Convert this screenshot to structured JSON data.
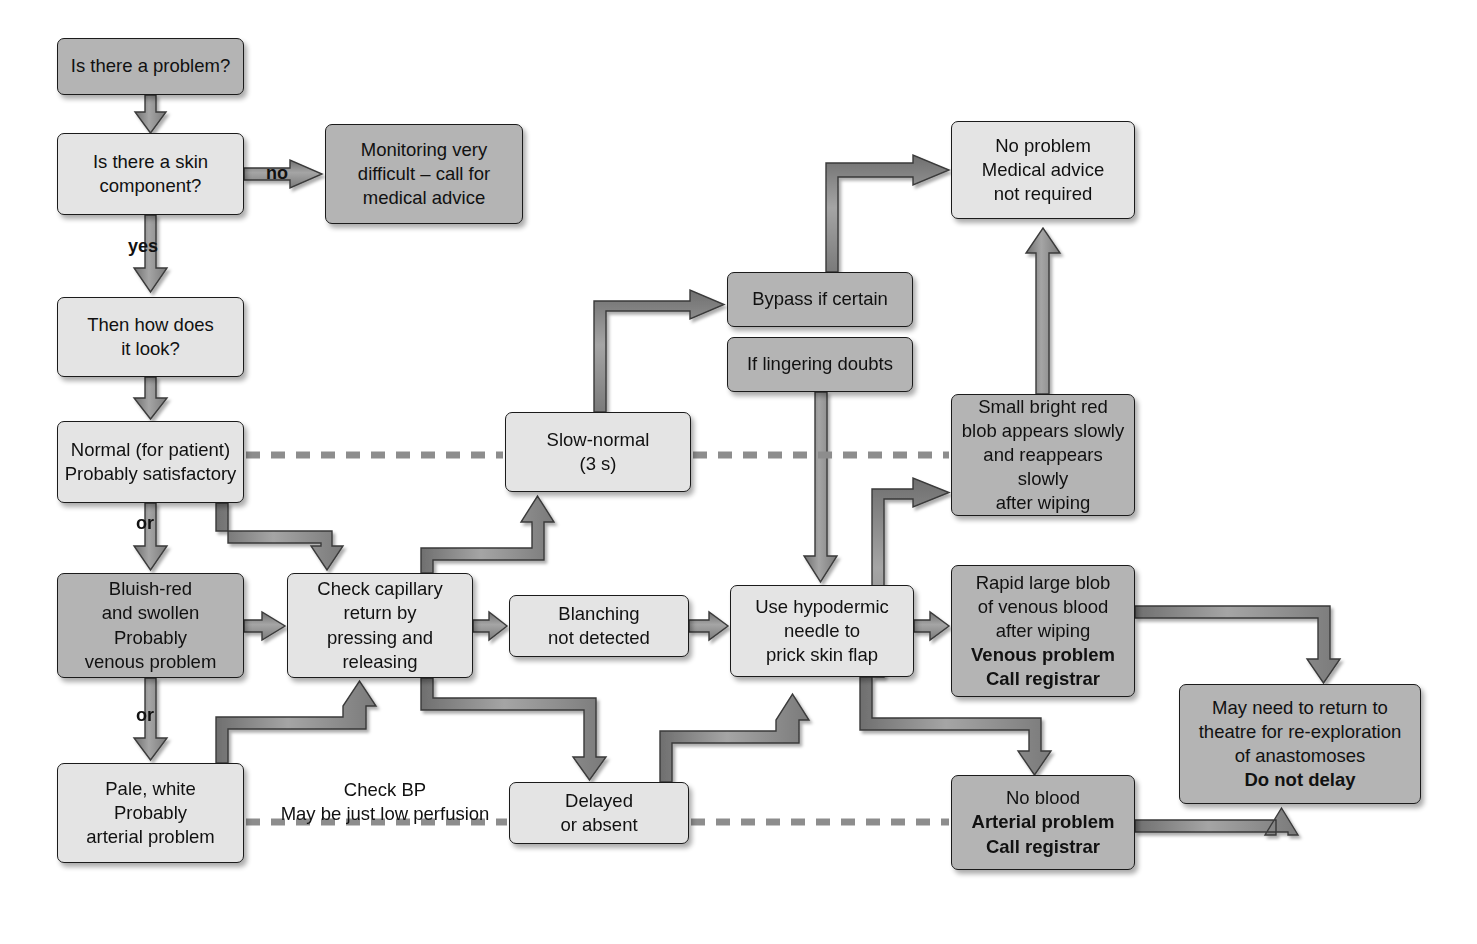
{
  "diagram": {
    "colors": {
      "fill_light": "#e4e4e4",
      "fill_dark": "#b4b4b4",
      "stroke": "#1b1b1b",
      "arrow_fill": "#8d8d8d",
      "arrow_stroke": "#3a3a3a",
      "dashed_line": "#8d8d8d",
      "background": "#ffffff"
    },
    "nodes": [
      {
        "id": "is_problem",
        "label": "Is there a problem?",
        "shade": "dark",
        "x": 57,
        "y": 38,
        "w": 187,
        "h": 57
      },
      {
        "id": "skin_component",
        "label": "Is there a skin\ncomponent?",
        "shade": "light",
        "x": 57,
        "y": 133,
        "w": 187,
        "h": 82
      },
      {
        "id": "monitoring",
        "label": "Monitoring very\ndifficult – call for\nmedical advice",
        "shade": "dark",
        "x": 325,
        "y": 124,
        "w": 198,
        "h": 100
      },
      {
        "id": "how_look",
        "label": "Then how does\nit look?",
        "shade": "light",
        "x": 57,
        "y": 297,
        "w": 187,
        "h": 80
      },
      {
        "id": "normal",
        "label": "Normal (for patient)\nProbably satisfactory",
        "shade": "light",
        "x": 57,
        "y": 421,
        "w": 187,
        "h": 82
      },
      {
        "id": "bluish_red",
        "label": "Bluish-red\nand swollen\nProbably\nvenous problem",
        "shade": "dark",
        "x": 57,
        "y": 573,
        "w": 187,
        "h": 105
      },
      {
        "id": "pale_white",
        "label": "Pale, white\nProbably\narterial problem",
        "shade": "light",
        "x": 57,
        "y": 763,
        "w": 187,
        "h": 100
      },
      {
        "id": "check_capillary",
        "label": "Check capillary\nreturn by\npressing and\nreleasing",
        "shade": "light",
        "x": 287,
        "y": 573,
        "w": 186,
        "h": 105
      },
      {
        "id": "slow_normal",
        "label": "Slow-normal\n(3 s)",
        "shade": "light",
        "x": 505,
        "y": 412,
        "w": 186,
        "h": 80
      },
      {
        "id": "blanching",
        "label": "Blanching\nnot detected",
        "shade": "light",
        "x": 509,
        "y": 595,
        "w": 180,
        "h": 62
      },
      {
        "id": "delayed",
        "label": "Delayed\nor absent",
        "shade": "light",
        "x": 509,
        "y": 782,
        "w": 180,
        "h": 62
      },
      {
        "id": "bypass",
        "label": "Bypass if certain",
        "shade": "dark",
        "x": 727,
        "y": 272,
        "w": 186,
        "h": 55
      },
      {
        "id": "lingering",
        "label": "If lingering doubts",
        "shade": "dark",
        "x": 727,
        "y": 337,
        "w": 186,
        "h": 55
      },
      {
        "id": "hypodermic",
        "label": "Use hypodermic\nneedle to\nprick skin flap",
        "shade": "light",
        "x": 730,
        "y": 585,
        "w": 184,
        "h": 92
      },
      {
        "id": "no_problem",
        "label": "No problem\nMedical advice\nnot required",
        "shade": "light",
        "x": 951,
        "y": 121,
        "w": 184,
        "h": 98
      },
      {
        "id": "small_blob",
        "label": "Small bright red\nblob appears slowly\nand reappears slowly\nafter wiping",
        "shade": "dark",
        "x": 951,
        "y": 394,
        "w": 184,
        "h": 122
      },
      {
        "id": "rapid_blob",
        "label": "Rapid large blob\nof venous blood\nafter wiping\n<b>Venous problem</b>\n<b>Call registrar</b>",
        "shade": "dark",
        "x": 951,
        "y": 565,
        "w": 184,
        "h": 132,
        "html": true
      },
      {
        "id": "no_blood",
        "label": "No blood\n<b>Arterial problem</b>\n<b>Call registrar</b>",
        "shade": "dark",
        "x": 951,
        "y": 775,
        "w": 184,
        "h": 95,
        "html": true
      },
      {
        "id": "theatre",
        "label": "May need to return to\ntheatre for re-exploration\nof anastomoses\n<b>Do not delay</b>",
        "shade": "dark",
        "x": 1179,
        "y": 684,
        "w": 242,
        "h": 120,
        "html": true
      }
    ],
    "edge_labels": [
      {
        "id": "no",
        "text": "no",
        "x": 266,
        "y": 163
      },
      {
        "id": "yes",
        "text": "yes",
        "x": 128,
        "y": 236
      },
      {
        "id": "or_1",
        "text": "or",
        "x": 132,
        "y": 520
      },
      {
        "id": "or_2",
        "text": "or",
        "x": 132,
        "y": 712
      }
    ],
    "free_labels": [
      {
        "id": "check_bp",
        "text": "Check BP\nMay be just low perfusion",
        "x": 270,
        "y": 778,
        "w": 230
      }
    ],
    "dashed_separators": [
      {
        "id": "dashed-upper-left",
        "x1": 246,
        "y1": 455,
        "x2": 503,
        "y2": 455
      },
      {
        "id": "dashed-upper-right",
        "x1": 693,
        "y1": 455,
        "x2": 949,
        "y2": 455
      },
      {
        "id": "dashed-lower-left",
        "x1": 246,
        "y1": 822,
        "x2": 507,
        "y2": 822
      },
      {
        "id": "dashed-lower-right",
        "x1": 691,
        "y1": 822,
        "x2": 949,
        "y2": 822
      }
    ],
    "connectors": [
      {
        "id": "is_problem-to-skin_component",
        "from": "is_problem",
        "to": "skin_component"
      },
      {
        "id": "skin_component-to-monitoring",
        "from": "skin_component",
        "to": "monitoring"
      },
      {
        "id": "skin_component-to-how_look",
        "from": "skin_component",
        "to": "how_look"
      },
      {
        "id": "how_look-to-normal",
        "from": "how_look",
        "to": "normal"
      },
      {
        "id": "normal-to-bluish_red",
        "from": "normal",
        "to": "bluish_red"
      },
      {
        "id": "normal-to-check_capillary",
        "from": "normal",
        "to": "check_capillary"
      },
      {
        "id": "bluish_red-to-pale_white",
        "from": "bluish_red",
        "to": "pale_white"
      },
      {
        "id": "bluish_red-to-check_capillary",
        "from": "bluish_red",
        "to": "check_capillary"
      },
      {
        "id": "pale_white-to-check_capillary",
        "from": "pale_white",
        "to": "check_capillary"
      },
      {
        "id": "check_capillary-to-slow_normal",
        "from": "check_capillary",
        "to": "slow_normal"
      },
      {
        "id": "check_capillary-to-blanching",
        "from": "check_capillary",
        "to": "blanching"
      },
      {
        "id": "check_capillary-to-delayed",
        "from": "check_capillary",
        "to": "delayed"
      },
      {
        "id": "slow_normal-to-bypass",
        "from": "slow_normal",
        "to": "bypass"
      },
      {
        "id": "bypass-lingering-to-hypodermic",
        "from": "lingering",
        "to": "hypodermic"
      },
      {
        "id": "blanching-to-hypodermic",
        "from": "blanching",
        "to": "hypodermic"
      },
      {
        "id": "delayed-to-hypodermic",
        "from": "delayed",
        "to": "hypodermic"
      },
      {
        "id": "hypodermic-to-small_blob",
        "from": "hypodermic",
        "to": "small_blob"
      },
      {
        "id": "hypodermic-to-rapid_blob",
        "from": "hypodermic",
        "to": "rapid_blob"
      },
      {
        "id": "hypodermic-to-no_blood",
        "from": "hypodermic",
        "to": "no_blood"
      },
      {
        "id": "small_blob-to-no_problem",
        "from": "small_blob",
        "to": "no_problem"
      },
      {
        "id": "bypass-to-no_problem",
        "from": "bypass",
        "to": "no_problem"
      },
      {
        "id": "rapid_blob-to-theatre",
        "from": "rapid_blob",
        "to": "theatre"
      },
      {
        "id": "no_blood-to-theatre",
        "from": "no_blood",
        "to": "theatre"
      }
    ]
  }
}
